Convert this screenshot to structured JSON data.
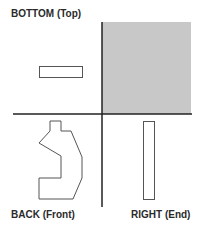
{
  "labels": {
    "top_left": "BOTTOM (Top)",
    "bottom_left": "BACK (Front)",
    "bottom_right": "RIGHT (End)"
  },
  "colors": {
    "line": "#222222",
    "shade": "#c8c8c8",
    "outline": "#555555"
  }
}
